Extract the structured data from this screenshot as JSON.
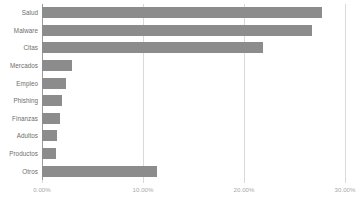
{
  "chart_data": {
    "type": "bar",
    "orientation": "horizontal",
    "title": "",
    "subtitle": "",
    "xlabel": "",
    "ylabel": "",
    "categories": [
      "Salud",
      "Malware",
      "Citas",
      "Mercados",
      "Empleo",
      "Phishing",
      "Finanzas",
      "Adultos",
      "Productos",
      "Otros"
    ],
    "values": [
      27.7,
      26.7,
      21.9,
      3.0,
      2.4,
      2.0,
      1.8,
      1.5,
      1.4,
      11.4
    ],
    "value_unit": "%",
    "xlim": [
      0,
      30
    ],
    "xticks": [
      0,
      10,
      20,
      30
    ],
    "xtick_labels": [
      "0.00%",
      "10.00%",
      "20.00%",
      "30.00%"
    ],
    "grid": true,
    "grid_axis": "x",
    "legend": false,
    "legend_position": "none",
    "bar_color": "#8c8c8c",
    "gridline_color": "#d9d9d9",
    "axis_color": "#9a9a9a",
    "label_color": "#6e6e6e",
    "tick_label_color": "#a8a8a8",
    "background_color": "#ffffff"
  }
}
